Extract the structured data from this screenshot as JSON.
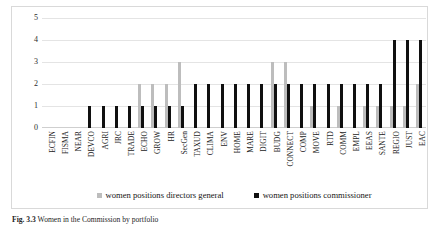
{
  "figure": {
    "caption_prefix": "Fig. 3.3",
    "caption_text": "Women in the Commission by portfolio"
  },
  "legend": {
    "position": "bottom-center",
    "items": [
      {
        "label": "women positions directors general",
        "color": "#bdbdbd"
      },
      {
        "label": "women positions commissioner",
        "color": "#101010"
      }
    ]
  },
  "chart_data": {
    "type": "bar",
    "title": "",
    "xlabel": "",
    "ylabel": "",
    "ylim": [
      0,
      5
    ],
    "yticks": [
      0,
      1,
      2,
      3,
      4,
      5
    ],
    "grid": true,
    "legend_position": "bottom-center",
    "categories": [
      "ECFIN",
      "FISMA",
      "NEAR",
      "DEVCO",
      "AGRI",
      "JRC",
      "TRADE",
      "ECHO",
      "GROW",
      "HR",
      "SecGen",
      "TAXUD",
      "CLIMA",
      "ENV",
      "HOME",
      "MARE",
      "DIGIT",
      "BUDG",
      "CONNECT",
      "COMP",
      "MOVE",
      "RTD",
      "COMM",
      "EMPL",
      "EEAS",
      "SANTE",
      "REGIO",
      "JUST",
      "EAC"
    ],
    "series": [
      {
        "name": "women positions directors general",
        "color": "#bdbdbd",
        "values": [
          0,
          0,
          0,
          0,
          0,
          0,
          0,
          2,
          2,
          2,
          3,
          0,
          0,
          0,
          0,
          0,
          0,
          3,
          3,
          0,
          1,
          0,
          1,
          0,
          1,
          1,
          1,
          1,
          2
        ]
      },
      {
        "name": "women positions commissioner",
        "color": "#101010",
        "values": [
          0,
          0,
          0,
          1,
          1,
          1,
          1,
          1,
          1,
          1,
          1,
          2,
          2,
          2,
          2,
          2,
          2,
          2,
          2,
          2,
          2,
          2,
          2,
          2,
          2,
          2,
          4,
          4,
          4
        ]
      }
    ]
  }
}
